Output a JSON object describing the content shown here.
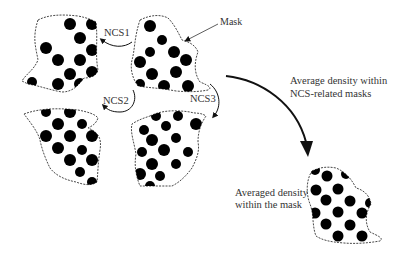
{
  "labels": {
    "mask": "Mask",
    "ncs1": "NCS1",
    "ncs2": "NCS2",
    "ncs3": "NCS3",
    "average_line1": "Average density within",
    "average_line2": "NCS-related masks",
    "averaged_line1": "Averaged density",
    "averaged_line2": "within the mask"
  },
  "colors": {
    "ink": "#000000",
    "text": "#333333",
    "background": "#ffffff"
  },
  "panels": [
    {
      "id": "copy-top-left",
      "role": "NCS copy"
    },
    {
      "id": "copy-top-right",
      "role": "reference copy with mask"
    },
    {
      "id": "copy-bottom-left",
      "role": "NCS copy"
    },
    {
      "id": "copy-bottom-right",
      "role": "NCS copy"
    },
    {
      "id": "averaged",
      "role": "averaged density"
    }
  ]
}
